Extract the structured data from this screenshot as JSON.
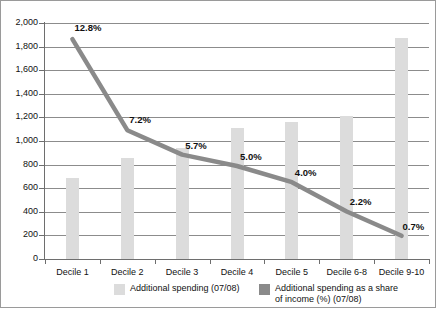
{
  "chart_data": {
    "type": "bar",
    "title": "",
    "xlabel": "",
    "ylabel": "",
    "categories": [
      "Decile 1",
      "Decile 2",
      "Decile 3",
      "Decile 4",
      "Decile 5",
      "Decile 6-8",
      "Decile 9-10"
    ],
    "ylim": [
      0,
      2000
    ],
    "ytick_labels": [
      "2,000",
      "1,800",
      "1,600",
      "1,400",
      "1,200",
      "1,000",
      "800",
      "600",
      "400",
      "200",
      "0"
    ],
    "ytick_values": [
      2000,
      1800,
      1600,
      1400,
      1200,
      1000,
      800,
      600,
      400,
      200,
      0
    ],
    "grid": true,
    "legend_position": "bottom",
    "series": [
      {
        "name": "Additional spending (07/08)",
        "type": "bar",
        "color": "#dcdcdc",
        "values": [
          690,
          860,
          945,
          1110,
          1160,
          1210,
          1870
        ]
      },
      {
        "name": "Additional spending as a share of income (%)  (07/08)",
        "type": "line",
        "color": "#8a8a8a",
        "axis": "secondary",
        "values": [
          12.8,
          7.2,
          5.7,
          5.0,
          4.0,
          2.2,
          0.7
        ],
        "point_labels": [
          "12.8%",
          "7.2%",
          "5.7%",
          "5.0%",
          "4.0%",
          "2.2%",
          "0.7%"
        ]
      }
    ]
  },
  "legend": {
    "entries": [
      {
        "label": "Additional spending (07/08)",
        "color": "#dcdcdc"
      },
      {
        "label": "Additional spending as a share",
        "label2": "of income (%)  (07/08)",
        "color": "#8a8a8a"
      }
    ]
  }
}
